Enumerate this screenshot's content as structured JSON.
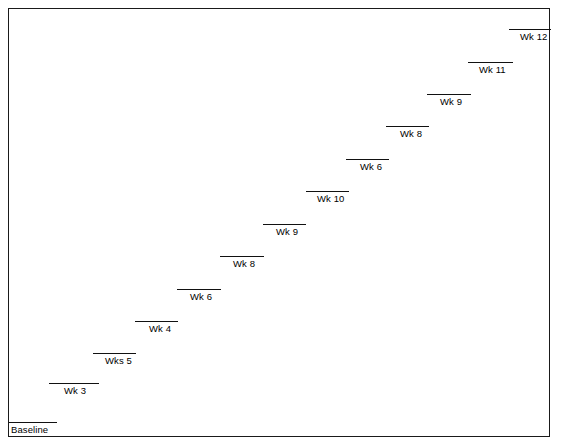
{
  "figure": {
    "name": "step-progression-chart",
    "frame_color": "#1a1a1a",
    "line_color": "#111111",
    "background": "#ffffff"
  },
  "chart_data": {
    "type": "bar",
    "title": "",
    "subtitle": "",
    "xlabel": "",
    "ylabel": "",
    "grid": false,
    "legend": null,
    "categories": [
      "Baseline",
      "Wk 3",
      "Wks 5",
      "Wk 4",
      "Wk 6",
      "Wk 8",
      "Wk 9",
      "Wk 10",
      "Wk 6",
      "Wk 8",
      "Wk 9",
      "Wk 11",
      "Wk 12"
    ],
    "values": [
      0,
      1,
      2,
      3,
      4,
      5,
      6,
      7,
      8,
      9,
      10,
      11,
      12
    ],
    "xlim": [
      0,
      13
    ],
    "ylim": [
      0,
      13
    ],
    "steps": [
      {
        "label": "Baseline",
        "index": 0,
        "line": {
          "x": 0,
          "y": 413,
          "width": 48
        },
        "label_pos": {
          "x": 2,
          "y": 415
        }
      },
      {
        "label": "Wk 3",
        "index": 1,
        "line": {
          "x": 40,
          "y": 374,
          "width": 50
        },
        "label_pos": {
          "x": 55,
          "y": 376
        }
      },
      {
        "label": "Wks 5",
        "index": 2,
        "line": {
          "x": 84,
          "y": 344,
          "width": 43
        },
        "label_pos": {
          "x": 96,
          "y": 346
        }
      },
      {
        "label": "Wk 4",
        "index": 3,
        "line": {
          "x": 126,
          "y": 312,
          "width": 43
        },
        "label_pos": {
          "x": 140,
          "y": 314
        }
      },
      {
        "label": "Wk 6",
        "index": 4,
        "line": {
          "x": 168,
          "y": 280,
          "width": 44
        },
        "label_pos": {
          "x": 181,
          "y": 282
        }
      },
      {
        "label": "Wk 8",
        "index": 5,
        "line": {
          "x": 211,
          "y": 247,
          "width": 44
        },
        "label_pos": {
          "x": 224,
          "y": 249
        }
      },
      {
        "label": "Wk 9",
        "index": 6,
        "line": {
          "x": 254,
          "y": 215,
          "width": 43
        },
        "label_pos": {
          "x": 267,
          "y": 217
        }
      },
      {
        "label": "Wk 10",
        "index": 7,
        "line": {
          "x": 297,
          "y": 182,
          "width": 43
        },
        "label_pos": {
          "x": 308,
          "y": 184
        }
      },
      {
        "label": "Wk 6",
        "index": 8,
        "line": {
          "x": 337,
          "y": 150,
          "width": 43
        },
        "label_pos": {
          "x": 351,
          "y": 152
        }
      },
      {
        "label": "Wk 8",
        "index": 9,
        "line": {
          "x": 377,
          "y": 117,
          "width": 43
        },
        "label_pos": {
          "x": 391,
          "y": 119
        }
      },
      {
        "label": "Wk 9",
        "index": 10,
        "line": {
          "x": 418,
          "y": 85,
          "width": 44
        },
        "label_pos": {
          "x": 431,
          "y": 87
        }
      },
      {
        "label": "Wk 11",
        "index": 11,
        "line": {
          "x": 459,
          "y": 53,
          "width": 45
        },
        "label_pos": {
          "x": 470,
          "y": 55
        }
      },
      {
        "label": "Wk 12",
        "index": 12,
        "line": {
          "x": 500,
          "y": 20,
          "width": 42
        },
        "label_pos": {
          "x": 511,
          "y": 22
        }
      }
    ]
  }
}
